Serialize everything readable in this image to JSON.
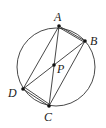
{
  "diagram": {
    "type": "geometry-circle-inscribed-quadrilateral",
    "circle": {
      "cx": 56,
      "cy": 67,
      "r": 39
    },
    "points": {
      "A": {
        "x": 59,
        "y": 26,
        "label": "A",
        "lx": 54,
        "ly": 21
      },
      "B": {
        "x": 85,
        "y": 41,
        "label": "B",
        "lx": 90,
        "ly": 45
      },
      "C": {
        "x": 49,
        "y": 106,
        "label": "C",
        "lx": 44,
        "ly": 121
      },
      "D": {
        "x": 23,
        "y": 89,
        "label": "D",
        "lx": 8,
        "ly": 97
      },
      "P": {
        "x": 54,
        "y": 65,
        "label": "P",
        "lx": 57,
        "ly": 73
      }
    },
    "segments": [
      [
        "A",
        "B"
      ],
      [
        "A",
        "B2"
      ],
      [
        "A",
        "D"
      ],
      [
        "A",
        "C"
      ],
      [
        "B",
        "D"
      ],
      [
        "B",
        "C"
      ],
      [
        "D",
        "C"
      ],
      [
        "D",
        "C2"
      ]
    ],
    "colors": {
      "stroke": "#333333",
      "point": "#111111"
    }
  }
}
